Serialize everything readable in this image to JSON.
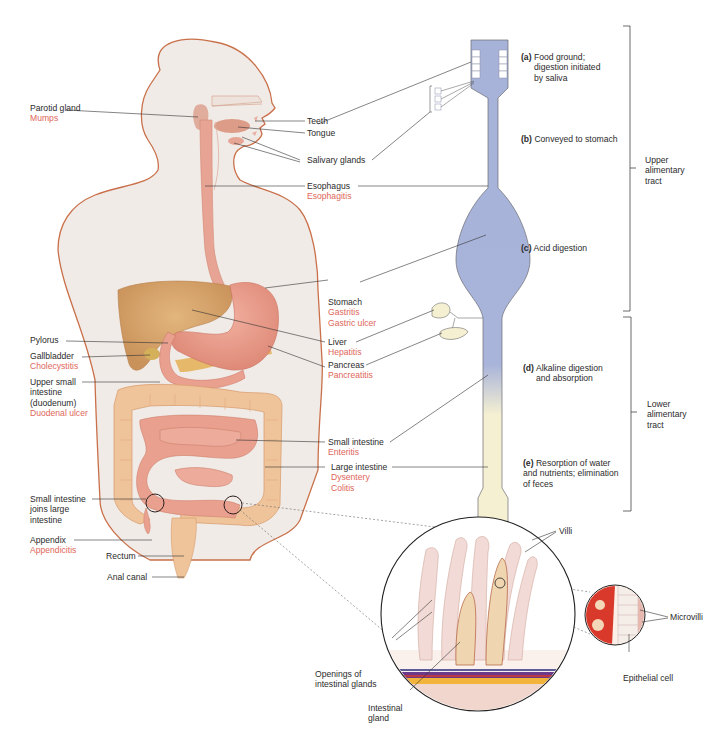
{
  "figure": {
    "left_labels": [
      {
        "id": "parotid",
        "name": "Parotid gland",
        "diseases": [
          "Mumps"
        ]
      },
      {
        "id": "pylorus",
        "name": "Pylorus",
        "diseases": []
      },
      {
        "id": "gallbladder",
        "name": "Gallbladder",
        "diseases": [
          "Cholecystitis"
        ]
      },
      {
        "id": "duodenum",
        "name": "Upper small intestine (duodenum)",
        "lines": [
          "Upper small",
          "intestine",
          "(duodenum)"
        ],
        "diseases": [
          "Duodenal ulcer"
        ]
      },
      {
        "id": "ileocecal",
        "name": "Small intestine joins large intestine",
        "lines": [
          "Small intestine",
          "joins large",
          "intestine"
        ],
        "diseases": []
      },
      {
        "id": "appendix",
        "name": "Appendix",
        "diseases": [
          "Appendicitis"
        ]
      },
      {
        "id": "rectum",
        "name": "Rectum",
        "diseases": []
      },
      {
        "id": "anal",
        "name": "Anal canal",
        "diseases": []
      }
    ],
    "center_labels": [
      {
        "id": "teeth",
        "name": "Teeth",
        "diseases": []
      },
      {
        "id": "tongue",
        "name": "Tongue",
        "diseases": []
      },
      {
        "id": "salivary",
        "name": "Salivary glands",
        "diseases": []
      },
      {
        "id": "esophagus",
        "name": "Esophagus",
        "diseases": [
          "Esophagitis"
        ]
      },
      {
        "id": "stomach",
        "name": "Stomach",
        "diseases": [
          "Gastritis",
          "Gastric ulcer"
        ]
      },
      {
        "id": "liver",
        "name": "Liver",
        "diseases": [
          "Hepatitis"
        ]
      },
      {
        "id": "pancreas",
        "name": "Pancreas",
        "diseases": [
          "Pancreatitis"
        ]
      },
      {
        "id": "small_intestine",
        "name": "Small intestine",
        "diseases": [
          "Enteritis"
        ]
      },
      {
        "id": "large_intestine",
        "name": "Large intestine",
        "diseases": [
          "Dysentery",
          "Colitis"
        ]
      }
    ],
    "tract_steps": [
      {
        "letter": "(a)",
        "lines": [
          "Food ground;",
          "digestion initiated",
          "by saliva"
        ]
      },
      {
        "letter": "(b)",
        "lines": [
          "Conveyed to stomach"
        ]
      },
      {
        "letter": "(c)",
        "lines": [
          "Acid digestion"
        ]
      },
      {
        "letter": "(d)",
        "lines": [
          "Alkaline digestion",
          "and absorption"
        ]
      },
      {
        "letter": "(e)",
        "lines": [
          "Resorption of water",
          "and nutrients; elimination",
          "of feces"
        ]
      }
    ],
    "brackets": [
      {
        "id": "upper",
        "lines": [
          "Upper",
          "alimentary",
          "tract"
        ]
      },
      {
        "id": "lower",
        "lines": [
          "Lower",
          "alimentary",
          "tract"
        ]
      }
    ],
    "inset_labels": {
      "villi": "Villi",
      "openings": [
        "Openings of",
        "intestinal glands"
      ],
      "gland": [
        "Intestinal",
        "gland"
      ],
      "microvilli": "Microvilli",
      "epithelial": "Epithelial cell"
    },
    "colors": {
      "body_fill": "#f1ebe7",
      "body_outline": "#c9704a",
      "organ_pink": "#e79a88",
      "liver": "#d4a068",
      "colon": "#f0c49a",
      "upper_tract": "#a7b2d8",
      "lower_tract": "#f5f0d2",
      "disease_text": "#e0665a",
      "label_text": "#2b2b2b"
    }
  }
}
